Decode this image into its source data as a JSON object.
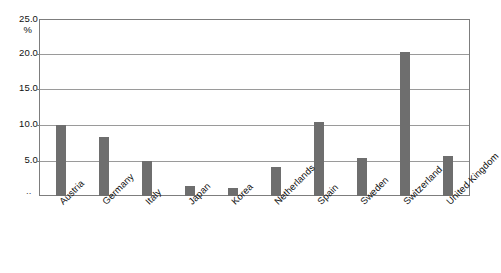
{
  "chart_data": {
    "type": "bar",
    "title": "",
    "subtitle": "",
    "xlabel": "",
    "ylabel": "%",
    "ylim": [
      0,
      25
    ],
    "ytick_labels": [
      "25.0",
      "20.0",
      "15.0",
      "10.0",
      "5.0"
    ],
    "yticks": [
      25.0,
      20.0,
      15.0,
      10.0,
      5.0
    ],
    "grid": true,
    "legend": false,
    "legend_position": "none",
    "axis_break_marker": "..",
    "categories": [
      "Austria",
      "Germany",
      "Italy",
      "Japan",
      "Korea",
      "Netherlands",
      "Spain",
      "Sweden",
      "Switzerland",
      "United Kingdom"
    ],
    "values": [
      10.0,
      8.3,
      5.0,
      1.4,
      1.2,
      4.1,
      10.4,
      5.4,
      20.3,
      5.7
    ],
    "series": [
      {
        "name": "",
        "values": [
          10.0,
          8.3,
          5.0,
          1.4,
          1.2,
          4.1,
          10.4,
          5.4,
          20.3,
          5.7
        ],
        "color": "#6e6e6e"
      }
    ],
    "annotations": []
  },
  "style": {
    "bar_color": "#6e6e6e",
    "gridline_color": "#9a9a9a",
    "frame_color": "#7d7d7d",
    "background": "#ffffff",
    "text_color": "#111111"
  }
}
